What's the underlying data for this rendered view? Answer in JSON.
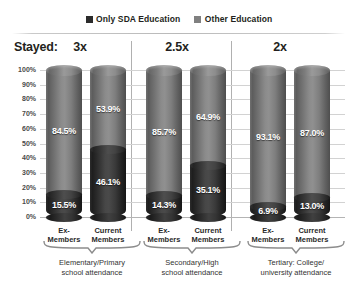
{
  "chart_data": {
    "type": "bar",
    "subtype": "stacked-100-percent-cylinder",
    "title": "",
    "xlabel": "",
    "ylabel": "",
    "ylim": [
      0,
      100
    ],
    "ytick_labels": [
      "100%",
      "90%",
      "80%",
      "70%",
      "60%",
      "50%",
      "40%",
      "30%",
      "20%",
      "10%",
      "0%"
    ],
    "ytick_values": [
      100,
      90,
      80,
      70,
      60,
      50,
      40,
      30,
      20,
      10,
      0
    ],
    "grid": true,
    "legend_position": "top-center",
    "legend": [
      "Only SDA Education",
      "Other Education"
    ],
    "categories": [
      "Ex-Members",
      "Current Members",
      "Ex-Members",
      "Current Members",
      "Ex-Members",
      "Current Members"
    ],
    "series": [
      {
        "name": "Only SDA Education",
        "values": [
          15.5,
          46.1,
          14.3,
          35.1,
          6.9,
          13.0
        ]
      },
      {
        "name": "Other Education",
        "values": [
          84.5,
          53.9,
          85.7,
          64.9,
          93.1,
          87.0
        ]
      }
    ],
    "groups": [
      {
        "multiplier": "3x",
        "caption_line1": "Elementary/Primary",
        "caption_line2": "school attendance"
      },
      {
        "multiplier": "2.5x",
        "caption_line1": "Secondary/High",
        "caption_line2": "school attendance"
      },
      {
        "multiplier": "2x",
        "caption_line1": "Tertiary: College/",
        "caption_line2": "university attendance"
      }
    ]
  },
  "legend": {
    "items": [
      {
        "label": "Only SDA Education",
        "color": "#2b2b2b"
      },
      {
        "label": "Other Education",
        "color": "#808080"
      }
    ]
  },
  "stayed": {
    "label": "Stayed:",
    "multipliers": [
      "3x",
      "2.5x",
      "2x"
    ]
  },
  "axis": {
    "ticks": [
      "100%",
      "90%",
      "80%",
      "70%",
      "60%",
      "50%",
      "40%",
      "30%",
      "20%",
      "10%",
      "0%"
    ]
  },
  "bars": [
    {
      "group": 0,
      "tick_line1": "Ex-",
      "tick_line2": "Members",
      "dark": "15.5%",
      "light": "84.5%",
      "dark_value": 15.5,
      "light_value": 84.5
    },
    {
      "group": 0,
      "tick_line1": "Current",
      "tick_line2": "Members",
      "dark": "46.1%",
      "light": "53.9%",
      "dark_value": 46.1,
      "light_value": 53.9
    },
    {
      "group": 1,
      "tick_line1": "Ex-",
      "tick_line2": "Members",
      "dark": "14.3%",
      "light": "85.7%",
      "dark_value": 14.3,
      "light_value": 85.7
    },
    {
      "group": 1,
      "tick_line1": "Current",
      "tick_line2": "Members",
      "dark": "35.1%",
      "light": "64.9%",
      "dark_value": 35.1,
      "light_value": 64.9
    },
    {
      "group": 2,
      "tick_line1": "Ex-",
      "tick_line2": "Members",
      "dark": "6.9%",
      "light": "93.1%",
      "dark_value": 6.9,
      "light_value": 93.1
    },
    {
      "group": 2,
      "tick_line1": "Current",
      "tick_line2": "Members",
      "dark": "13.0%",
      "light": "87.0%",
      "dark_value": 13.0,
      "light_value": 87.0
    }
  ],
  "captions": [
    {
      "line1": "Elementary/Primary",
      "line2": "school attendance"
    },
    {
      "line1": "Secondary/High",
      "line2": "school attendance"
    },
    {
      "line1": "Tertiary: College/",
      "line2": "university attendance"
    }
  ],
  "colors": {
    "dark_segment": "#2b2b2b",
    "light_segment": "#808080",
    "gridline": "#d2d2d2",
    "divider": "#b0b0b0",
    "text": "#231f20"
  }
}
